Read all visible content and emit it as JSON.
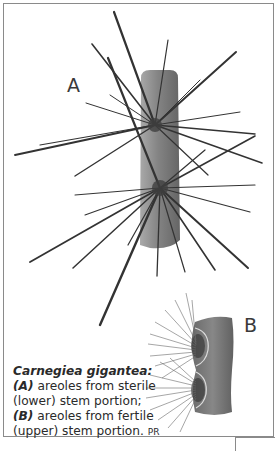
{
  "figure": {
    "label_a": "A",
    "label_b": "B",
    "caption": {
      "title": "Carnegiea gigantea:",
      "part_a_marker": "(A)",
      "part_a_text": " areoles from sterile (lower) stem portion; ",
      "part_b_marker": "(B)",
      "part_b_text": " areoles from fertile (upper) stem portion. ",
      "credit": "PR"
    }
  },
  "colors": {
    "frame": "#8a8a8a",
    "ink": "#2a2a2a",
    "stem": "#6b6b6b"
  }
}
